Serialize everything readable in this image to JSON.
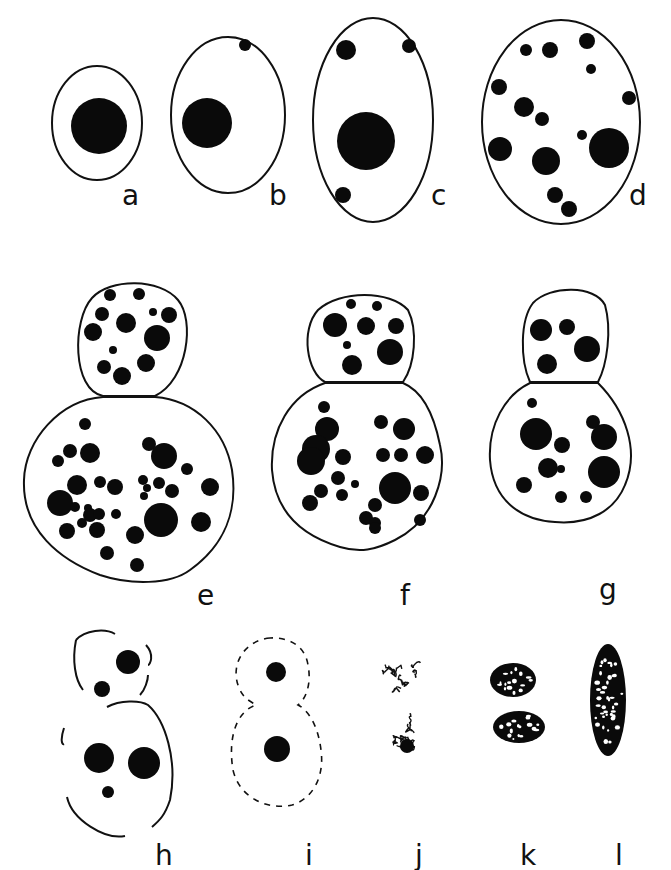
{
  "figure": {
    "stroke_color": "#111111",
    "fill_color": "#0a0a0a",
    "background": "#ffffff"
  },
  "panels": [
    {
      "id": "a",
      "label": "a",
      "label_pos": [
        130,
        172
      ],
      "outlines": [
        {
          "type": "ellipse",
          "cx": 97,
          "cy": 123,
          "rx": 45,
          "ry": 57
        }
      ],
      "dots": [
        [
          99,
          126,
          28
        ]
      ]
    },
    {
      "id": "b",
      "label": "b",
      "label_pos": [
        277,
        172
      ],
      "outlines": [
        {
          "type": "ellipse",
          "cx": 228,
          "cy": 115,
          "rx": 57,
          "ry": 78
        }
      ],
      "dots": [
        [
          207,
          123,
          25
        ],
        [
          245,
          45,
          6
        ]
      ]
    },
    {
      "id": "c",
      "label": "c",
      "label_pos": [
        439,
        172
      ],
      "outlines": [
        {
          "type": "ellipse",
          "cx": 373,
          "cy": 120,
          "rx": 60,
          "ry": 102
        }
      ],
      "dots": [
        [
          366,
          141,
          29
        ],
        [
          346,
          50,
          10
        ],
        [
          409,
          46,
          7
        ],
        [
          343,
          195,
          8
        ]
      ]
    },
    {
      "id": "d",
      "label": "d",
      "label_pos": [
        637,
        172
      ],
      "outlines": [
        {
          "type": "ellipse",
          "cx": 561,
          "cy": 122,
          "rx": 79,
          "ry": 102
        }
      ],
      "dots": [
        [
          526,
          50,
          6
        ],
        [
          550,
          50,
          8
        ],
        [
          587,
          41,
          8
        ],
        [
          591,
          69,
          5
        ],
        [
          499,
          87,
          8
        ],
        [
          524,
          107,
          10
        ],
        [
          542,
          119,
          7
        ],
        [
          582,
          135,
          5
        ],
        [
          609,
          148,
          20
        ],
        [
          500,
          149,
          12
        ],
        [
          546,
          161,
          14
        ],
        [
          555,
          195,
          8
        ],
        [
          569,
          209,
          8
        ],
        [
          629,
          98,
          7
        ]
      ]
    },
    {
      "id": "e",
      "label": "e",
      "label_pos": [
        205,
        572
      ],
      "outlines": [
        {
          "type": "path",
          "d": "M103 396 C72 390 72 320 92 298 C110 278 160 278 178 300 C195 320 188 380 155 396 Z"
        },
        {
          "type": "path",
          "d": "M103 397 C60 400 25 440 24 480 C22 530 60 560 100 575 C130 585 170 585 190 570 C225 545 238 510 232 470 C225 430 195 400 155 397 Z"
        }
      ],
      "dots": [
        [
          110,
          295,
          6
        ],
        [
          139,
          294,
          6
        ],
        [
          102,
          314,
          7
        ],
        [
          126,
          323,
          10
        ],
        [
          153,
          312,
          4
        ],
        [
          169,
          315,
          8
        ],
        [
          93,
          332,
          9
        ],
        [
          157,
          338,
          13
        ],
        [
          113,
          350,
          4
        ],
        [
          146,
          363,
          9
        ],
        [
          104,
          367,
          7
        ],
        [
          122,
          376,
          9
        ],
        [
          85,
          424,
          6
        ],
        [
          90,
          453,
          10
        ],
        [
          70,
          451,
          7
        ],
        [
          58,
          461,
          6
        ],
        [
          77,
          485,
          10
        ],
        [
          100,
          482,
          6
        ],
        [
          115,
          487,
          8
        ],
        [
          60,
          503,
          13
        ],
        [
          88,
          508,
          4
        ],
        [
          75,
          507,
          5
        ],
        [
          90,
          515,
          7
        ],
        [
          82,
          523,
          5
        ],
        [
          99,
          514,
          6
        ],
        [
          116,
          514,
          5
        ],
        [
          149,
          444,
          7
        ],
        [
          164,
          456,
          13
        ],
        [
          187,
          469,
          6
        ],
        [
          143,
          480,
          5
        ],
        [
          159,
          483,
          6
        ],
        [
          147,
          488,
          4
        ],
        [
          172,
          491,
          7
        ],
        [
          144,
          496,
          4
        ],
        [
          210,
          487,
          9
        ],
        [
          161,
          520,
          17
        ],
        [
          201,
          522,
          10
        ],
        [
          67,
          531,
          8
        ],
        [
          97,
          530,
          8
        ],
        [
          135,
          535,
          9
        ],
        [
          107,
          553,
          7
        ],
        [
          137,
          565,
          7
        ]
      ]
    },
    {
      "id": "f",
      "label": "f",
      "label_pos": [
        408,
        572
      ],
      "outlines": [
        {
          "type": "path",
          "d": "M325 382 C307 373 300 330 318 310 C340 290 390 290 408 310 C418 330 415 365 403 382 Z"
        },
        {
          "type": "path",
          "d": "M325 383 C290 395 270 430 272 470 C275 510 300 535 340 547 C360 553 375 550 395 540 C435 520 447 475 440 445 C433 410 420 390 403 383 Z"
        }
      ],
      "dots": [
        [
          351,
          304,
          5
        ],
        [
          377,
          306,
          5
        ],
        [
          335,
          325,
          12
        ],
        [
          366,
          326,
          9
        ],
        [
          396,
          326,
          8
        ],
        [
          347,
          345,
          4
        ],
        [
          390,
          352,
          13
        ],
        [
          352,
          365,
          10
        ],
        [
          324,
          407,
          6
        ],
        [
          327,
          429,
          12
        ],
        [
          316,
          449,
          14
        ],
        [
          311,
          461,
          14
        ],
        [
          343,
          457,
          8
        ],
        [
          338,
          478,
          7
        ],
        [
          321,
          491,
          7
        ],
        [
          342,
          495,
          6
        ],
        [
          355,
          484,
          4
        ],
        [
          310,
          503,
          8
        ],
        [
          366,
          518,
          7
        ],
        [
          375,
          523,
          6
        ],
        [
          381,
          422,
          7
        ],
        [
          404,
          429,
          11
        ],
        [
          383,
          455,
          7
        ],
        [
          401,
          455,
          7
        ],
        [
          425,
          455,
          9
        ],
        [
          395,
          488,
          16
        ],
        [
          421,
          493,
          8
        ],
        [
          375,
          505,
          7
        ],
        [
          375,
          528,
          6
        ],
        [
          420,
          520,
          6
        ]
      ]
    },
    {
      "id": "g",
      "label": "g",
      "label_pos": [
        607,
        566
      ],
      "outlines": [
        {
          "type": "path",
          "d": "M530 382 C520 360 520 320 533 303 C550 285 595 285 605 305 C612 330 607 365 598 382 Z"
        },
        {
          "type": "path",
          "d": "M530 383 C505 395 488 425 490 460 C493 500 520 520 555 522 C590 525 615 510 625 485 C640 450 625 410 598 383 Z"
        }
      ],
      "dots": [
        [
          541,
          330,
          11
        ],
        [
          567,
          327,
          8
        ],
        [
          587,
          349,
          13
        ],
        [
          547,
          364,
          10
        ],
        [
          532,
          403,
          5
        ],
        [
          536,
          434,
          16
        ],
        [
          562,
          445,
          8
        ],
        [
          593,
          422,
          7
        ],
        [
          604,
          437,
          13
        ],
        [
          548,
          468,
          10
        ],
        [
          561,
          469,
          4
        ],
        [
          604,
          472,
          16
        ],
        [
          524,
          485,
          8
        ],
        [
          561,
          497,
          6
        ],
        [
          586,
          497,
          6
        ]
      ]
    },
    {
      "id": "h",
      "label": "h",
      "label_pos": [
        163,
        832
      ],
      "outlines": [
        {
          "type": "dashed-heavy",
          "d": "M76 640 C85 630 105 628 115 634 M146 645 C155 655 150 665 148 665 M76 640 C72 660 75 680 83 690 M148 675 C148 680 145 690 140 695"
        },
        {
          "type": "path",
          "d": "M107 707 C120 700 140 700 148 705 C165 720 178 760 170 800 C165 815 160 820 152 827"
        },
        {
          "type": "dashed-heavy",
          "d": "M64 728 C60 740 62 745 64 744 M67 797 C72 820 105 840 125 836"
        }
      ],
      "dots": [
        [
          128,
          662,
          12
        ],
        [
          102,
          689,
          8
        ],
        [
          99,
          758,
          15
        ],
        [
          144,
          763,
          16
        ],
        [
          108,
          792,
          6
        ]
      ]
    },
    {
      "id": "i",
      "label": "i",
      "label_pos": [
        313,
        832
      ],
      "outlines": [
        {
          "type": "dashed",
          "d": "M270 638 C245 640 228 665 240 690 C245 700 252 702 256 705 C235 712 228 740 233 770 C240 800 270 810 292 805 C310 800 325 780 321 750 C318 725 308 710 298 705 C305 700 312 685 308 665 C305 645 288 637 270 638 Z"
        }
      ],
      "dots": [
        [
          276,
          672,
          10
        ],
        [
          277,
          749,
          13
        ]
      ]
    },
    {
      "id": "j",
      "label": "j",
      "label_pos": [
        423,
        832
      ],
      "outlines": [],
      "blobs": [
        {
          "type": "chromatin-loose",
          "cx": 403,
          "cy": 670,
          "r": 24
        },
        {
          "type": "chromatin-loose",
          "cx": 405,
          "cy": 740,
          "r": 26,
          "nucleolus": [
            407,
            746,
            7
          ]
        }
      ],
      "dots": []
    },
    {
      "id": "k",
      "label": "k",
      "label_pos": [
        528,
        832
      ],
      "outlines": [],
      "blobs": [
        {
          "type": "chromatin-dense",
          "cx": 513,
          "cy": 680,
          "rx": 23,
          "ry": 17
        },
        {
          "type": "chromatin-dense",
          "cx": 519,
          "cy": 727,
          "rx": 26,
          "ry": 16
        }
      ],
      "dots": []
    },
    {
      "id": "l",
      "label": "l",
      "label_pos": [
        623,
        832
      ],
      "outlines": [],
      "blobs": [
        {
          "type": "chromatin-rod",
          "cx": 608,
          "cy": 700,
          "rx": 18,
          "ry": 56
        }
      ],
      "dots": []
    }
  ]
}
